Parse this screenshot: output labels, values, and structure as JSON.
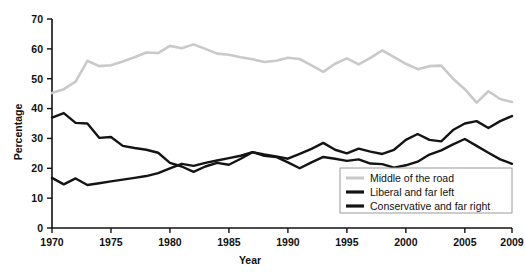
{
  "chart_data": {
    "type": "line",
    "title": "",
    "xlabel": "Year",
    "ylabel": "Percentage",
    "xlim": [
      1970,
      2009
    ],
    "ylim": [
      0,
      70
    ],
    "yticks": [
      0,
      10,
      20,
      30,
      40,
      50,
      60,
      70
    ],
    "xticks": [
      1970,
      1975,
      1980,
      1985,
      1990,
      1995,
      2000,
      2005,
      2009
    ],
    "grid": false,
    "legend_position": "bottom-right",
    "x": [
      1970,
      1971,
      1972,
      1973,
      1974,
      1975,
      1976,
      1977,
      1978,
      1979,
      1980,
      1981,
      1982,
      1983,
      1984,
      1985,
      1986,
      1987,
      1988,
      1989,
      1990,
      1991,
      1992,
      1993,
      1994,
      1995,
      1996,
      1997,
      1998,
      1999,
      2000,
      2001,
      2002,
      2003,
      2004,
      2005,
      2006,
      2007,
      2008,
      2009
    ],
    "series": [
      {
        "name": "Middle of the road",
        "color": "#c9c9c9",
        "values": [
          45.2,
          46.5,
          49.0,
          56.0,
          54.2,
          54.5,
          55.8,
          57.2,
          58.8,
          58.6,
          61.0,
          60.2,
          61.5,
          60.0,
          58.4,
          58.0,
          57.2,
          56.5,
          55.6,
          56.0,
          57.0,
          56.6,
          54.5,
          52.3,
          55.0,
          56.8,
          54.8,
          57.0,
          59.5,
          57.2,
          55.0,
          53.2,
          54.2,
          54.4,
          50.0,
          46.5,
          42.0,
          45.8,
          43.2,
          42.2
        ]
      },
      {
        "name": "Liberal and far left",
        "color": "#141414",
        "values": [
          37.0,
          38.5,
          35.2,
          35.0,
          30.2,
          30.5,
          27.5,
          26.8,
          26.2,
          25.2,
          21.8,
          20.6,
          18.8,
          20.6,
          21.8,
          21.2,
          23.2,
          25.4,
          24.6,
          24.0,
          23.2,
          24.8,
          26.5,
          28.5,
          26.2,
          25.0,
          26.6,
          25.6,
          24.8,
          26.2,
          29.5,
          31.5,
          29.5,
          29.0,
          32.8,
          35.0,
          35.8,
          33.5,
          35.8,
          37.5
        ]
      },
      {
        "name": "Conservative and far right",
        "color": "#141414",
        "values": [
          16.8,
          14.6,
          16.6,
          14.4,
          15.0,
          15.6,
          16.2,
          16.8,
          17.4,
          18.4,
          20.0,
          21.5,
          20.8,
          21.8,
          22.6,
          23.4,
          24.2,
          25.4,
          24.2,
          23.8,
          22.0,
          20.0,
          22.0,
          23.8,
          23.2,
          22.5,
          23.0,
          21.6,
          21.4,
          20.2,
          21.0,
          22.2,
          24.6,
          26.0,
          28.0,
          29.8,
          27.5,
          25.2,
          23.0,
          21.5
        ]
      }
    ]
  },
  "legend": {
    "items": [
      {
        "label": "Middle of the road"
      },
      {
        "label": "Liberal and far left"
      },
      {
        "label": "Conservative and far right"
      }
    ]
  },
  "axis": {
    "y_title": "Percentage",
    "x_title": "Year"
  }
}
